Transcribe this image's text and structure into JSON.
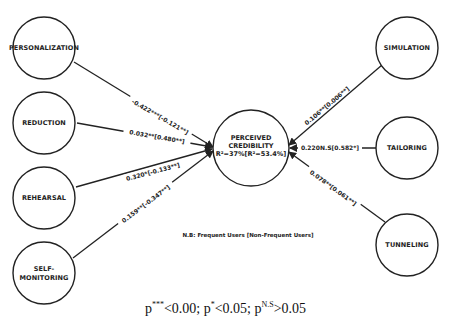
{
  "diagram": {
    "center": {
      "line1": "PERCEIVED",
      "line2": "CREDIBILITY",
      "line3": "R²=37%[R²=53.4%]"
    },
    "left_nodes": [
      {
        "label": "PERSONALIZATION",
        "edge_label": "-0.422***[-0.121**]"
      },
      {
        "label": "REDUCTION",
        "edge_label": "0.032**[0.480**]"
      },
      {
        "label": "REHEARSAL",
        "edge_label": "0.320*[-0.133**]"
      },
      {
        "label_line1": "SELF-",
        "label_line2": "MONITORING",
        "edge_label": "0.159**[-0.347**]"
      }
    ],
    "right_nodes": [
      {
        "label": "SIMULATION",
        "edge_label": "0.106**[0.006**]"
      },
      {
        "label": "TAILORING",
        "edge_label": "0.220N.S[0.582*]"
      },
      {
        "label": "TUNNELING",
        "edge_label": "0.078**[0.061**]"
      }
    ],
    "note": "N.B: Frequent Users [Non-Frequent Users]"
  },
  "legend": {
    "p1": "p",
    "s1": "***",
    "t1": "<0.00; p",
    "s2": "*",
    "t2": "<0.05; p",
    "s3": "N.S",
    "t3": ">0.05"
  }
}
